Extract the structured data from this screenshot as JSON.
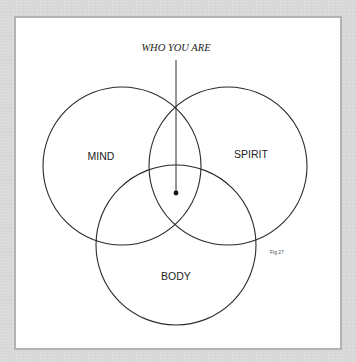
{
  "diagram": {
    "title": "WHO YOU ARE",
    "figure_label": "Fig 27",
    "circles": [
      {
        "label": "MIND",
        "cx": 122,
        "cy": 166,
        "r": 79
      },
      {
        "label": "SPIRIT",
        "cx": 228,
        "cy": 166,
        "r": 79
      },
      {
        "label": "BODY",
        "cx": 176,
        "cy": 245,
        "r": 80
      }
    ],
    "pointer": {
      "x": 176,
      "y_top": 60,
      "y_dot": 193
    },
    "colors": {
      "background": "#d9d9d9",
      "panel": "#ffffff",
      "panel_border": "#b3b3b3",
      "stroke": "#2a2a2a"
    }
  }
}
